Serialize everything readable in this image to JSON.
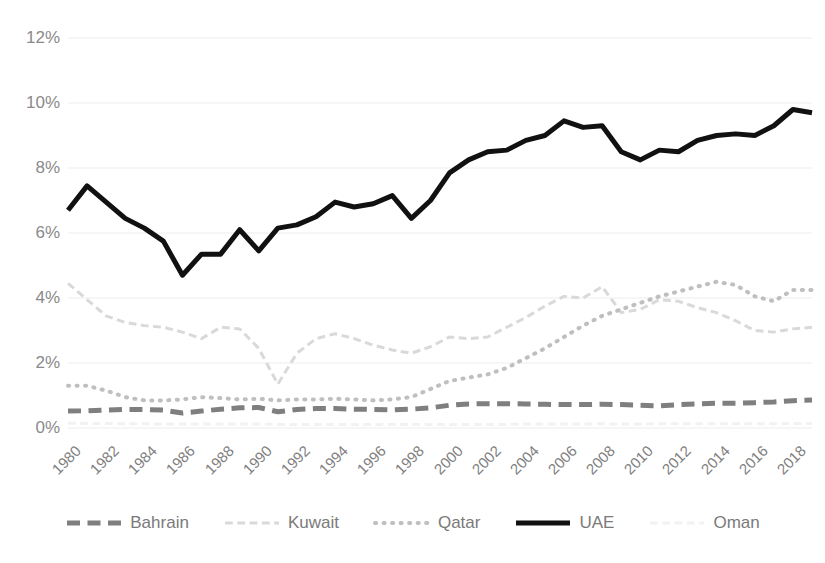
{
  "chart_data": {
    "type": "line",
    "title": "",
    "xlabel": "",
    "ylabel": "",
    "ylim": [
      0,
      12
    ],
    "ytick_labels": [
      "12%",
      "10%",
      "8%",
      "6%",
      "4%",
      "2%",
      "0%"
    ],
    "ytick_values": [
      12,
      10,
      8,
      6,
      4,
      2,
      0
    ],
    "grid": true,
    "grid_axis": "y",
    "legend_position": "bottom",
    "x": [
      1980,
      1981,
      1982,
      1983,
      1984,
      1985,
      1986,
      1987,
      1988,
      1989,
      1990,
      1991,
      1992,
      1993,
      1994,
      1995,
      1996,
      1997,
      1998,
      1999,
      2000,
      2001,
      2002,
      2003,
      2004,
      2005,
      2006,
      2007,
      2008,
      2009,
      2010,
      2011,
      2012,
      2013,
      2014,
      2015,
      2016,
      2017,
      2018,
      2019
    ],
    "xtick_labels": [
      "1980",
      "1982",
      "1984",
      "1986",
      "1988",
      "1990",
      "1992",
      "1994",
      "1996",
      "1998",
      "2000",
      "2002",
      "2004",
      "2006",
      "2008",
      "2010",
      "2012",
      "2014",
      "2016",
      "2018"
    ],
    "series": [
      {
        "name": "Bahrain",
        "color": "#7f7f7f",
        "style": "dashed",
        "width": 5,
        "values": [
          0.52,
          0.53,
          0.55,
          0.57,
          0.57,
          0.55,
          0.46,
          0.52,
          0.58,
          0.62,
          0.63,
          0.5,
          0.57,
          0.6,
          0.6,
          0.58,
          0.57,
          0.56,
          0.58,
          0.62,
          0.7,
          0.74,
          0.75,
          0.75,
          0.74,
          0.73,
          0.72,
          0.72,
          0.73,
          0.72,
          0.7,
          0.68,
          0.72,
          0.74,
          0.76,
          0.76,
          0.78,
          0.8,
          0.84,
          0.86
        ]
      },
      {
        "name": "Kuwait",
        "color": "#d9d9d9",
        "style": "dashed",
        "width": 3,
        "values": [
          4.45,
          3.95,
          3.45,
          3.25,
          3.15,
          3.1,
          2.95,
          2.75,
          3.1,
          3.05,
          2.45,
          1.35,
          2.3,
          2.75,
          2.9,
          2.75,
          2.55,
          2.4,
          2.3,
          2.5,
          2.8,
          2.75,
          2.8,
          3.1,
          3.4,
          3.75,
          4.05,
          4.0,
          4.35,
          3.55,
          3.65,
          3.95,
          3.9,
          3.7,
          3.55,
          3.3,
          3.0,
          2.95,
          3.05,
          3.1
        ]
      },
      {
        "name": "Qatar",
        "color": "#bfbfbf",
        "style": "dotted",
        "width": 4,
        "values": [
          1.3,
          1.3,
          1.15,
          0.95,
          0.85,
          0.85,
          0.88,
          0.95,
          0.92,
          0.88,
          0.9,
          0.85,
          0.88,
          0.88,
          0.9,
          0.88,
          0.85,
          0.88,
          0.95,
          1.2,
          1.45,
          1.55,
          1.65,
          1.85,
          2.15,
          2.45,
          2.8,
          3.15,
          3.45,
          3.65,
          3.85,
          4.05,
          4.2,
          4.35,
          4.5,
          4.4,
          4.05,
          3.9,
          4.25,
          4.25
        ]
      },
      {
        "name": "UAE",
        "color": "#111111",
        "style": "solid",
        "width": 5,
        "values": [
          6.7,
          7.45,
          6.95,
          6.45,
          6.15,
          5.75,
          4.7,
          5.35,
          5.35,
          6.1,
          5.45,
          6.15,
          6.25,
          6.5,
          6.95,
          6.8,
          6.9,
          7.15,
          6.45,
          7.0,
          7.85,
          8.25,
          8.5,
          8.55,
          8.85,
          9.0,
          9.45,
          9.25,
          9.3,
          8.5,
          8.25,
          8.55,
          8.5,
          8.85,
          9.0,
          9.05,
          9.0,
          9.3,
          9.8,
          9.7
        ]
      },
      {
        "name": "Oman",
        "color": "#f2f2f2",
        "style": "dashed",
        "width": 3,
        "values": [
          0.15,
          0.14,
          0.14,
          0.13,
          0.13,
          0.12,
          0.12,
          0.12,
          0.12,
          0.12,
          0.12,
          0.11,
          0.11,
          0.11,
          0.11,
          0.11,
          0.11,
          0.11,
          0.11,
          0.11,
          0.11,
          0.11,
          0.11,
          0.11,
          0.12,
          0.12,
          0.12,
          0.12,
          0.13,
          0.12,
          0.12,
          0.13,
          0.13,
          0.13,
          0.13,
          0.13,
          0.13,
          0.13,
          0.14,
          0.14
        ]
      }
    ]
  },
  "legend": {
    "items": [
      {
        "label": "Bahrain",
        "marker": "dash-marker-dark"
      },
      {
        "label": "Kuwait",
        "marker": "dash-marker-light"
      },
      {
        "label": "Qatar",
        "marker": "dot-marker"
      },
      {
        "label": "UAE",
        "marker": "solid-marker"
      },
      {
        "label": "Oman",
        "marker": "dash-marker-faint"
      }
    ]
  }
}
